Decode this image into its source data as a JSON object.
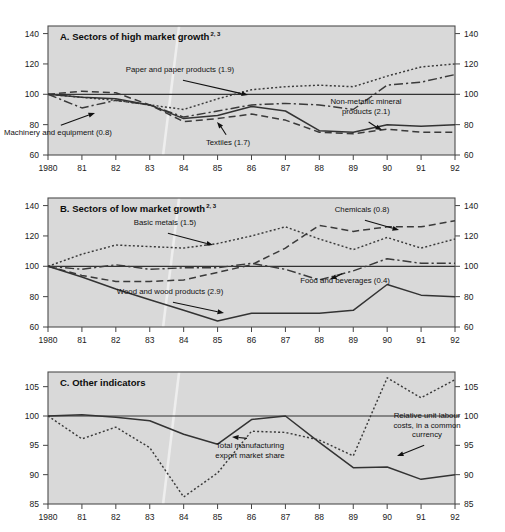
{
  "figure": {
    "width": 505,
    "height": 532,
    "background": "#ffffff",
    "plot_background": "#d9d9d9",
    "frame_color": "#4d4d4d"
  },
  "panels": [
    {
      "id": "panel-a",
      "key": "A",
      "title": "A.   Sectors of high market growth",
      "title_superscript": "2, 3",
      "ylim": [
        60,
        145
      ],
      "yticks": [
        60,
        80,
        100,
        120,
        140
      ],
      "reference_value": 100,
      "xticks": [
        "1980",
        "81",
        "82",
        "83",
        "84",
        "85",
        "86",
        "87",
        "88",
        "89",
        "90",
        "91",
        "92"
      ]
    },
    {
      "id": "panel-b",
      "key": "B",
      "title": "B.   Sectors of low market growth",
      "title_superscript": "2, 3",
      "ylim": [
        60,
        145
      ],
      "yticks": [
        60,
        80,
        100,
        120,
        140
      ],
      "reference_value": 100,
      "xticks": [
        "1980",
        "81",
        "82",
        "83",
        "84",
        "85",
        "86",
        "87",
        "88",
        "89",
        "90",
        "91",
        "92"
      ]
    },
    {
      "id": "panel-c",
      "key": "C",
      "title": "C.   Other indicators",
      "title_superscript": "",
      "ylim": [
        85,
        107.5
      ],
      "yticks": [
        85,
        90,
        95,
        100,
        105
      ],
      "reference_value": 100,
      "xticks": [
        "1980",
        "81",
        "82",
        "83",
        "84",
        "85",
        "86",
        "87",
        "88",
        "89",
        "90",
        "91",
        "92"
      ]
    }
  ],
  "chart_data": [
    {
      "type": "line",
      "panel": "A",
      "title": "A.   Sectors of high market growth",
      "title_superscript": "2, 3",
      "xlabel": "",
      "ylabel": "",
      "x": [
        1980,
        1981,
        1982,
        1983,
        1984,
        1985,
        1986,
        1987,
        1988,
        1989,
        1990,
        1991,
        1992
      ],
      "xtick_labels": [
        "1980",
        "81",
        "82",
        "83",
        "84",
        "85",
        "86",
        "87",
        "88",
        "89",
        "90",
        "91",
        "92"
      ],
      "ylim": [
        60,
        145
      ],
      "yticks": [
        60,
        80,
        100,
        120,
        140
      ],
      "grid": false,
      "reference_line": 100,
      "legend": "inline annotations with arrows",
      "series": [
        {
          "name": "Paper and paper products (1.9)",
          "label": "Paper and paper products (1.9)",
          "style": "dotted",
          "color": "#3a3a3a",
          "values": [
            100,
            98,
            96,
            93,
            90,
            97,
            103,
            105,
            106,
            105,
            112,
            118,
            120
          ]
        },
        {
          "name": "Non-metallic mineral products (2.1)",
          "label": "Non-metallic mineral products (2.1)",
          "style": "dashdot",
          "color": "#3a3a3a",
          "values": [
            100,
            91,
            96,
            93,
            85,
            89,
            93,
            94,
            93,
            90,
            106,
            108,
            113
          ]
        },
        {
          "name": "Textiles (1.7)",
          "label": "Textiles (1.7)",
          "style": "dashed",
          "color": "#3a3a3a",
          "values": [
            100,
            102,
            101,
            93,
            82,
            84,
            87,
            83,
            75,
            74,
            77,
            75,
            75
          ]
        },
        {
          "name": "Machinery and equipment (0.8)",
          "label": "Machinery and equipment (0.8)",
          "style": "solid",
          "color": "#333333",
          "values": [
            100,
            98,
            97,
            93,
            84,
            86,
            92,
            89,
            76,
            75,
            80,
            79,
            80
          ]
        }
      ],
      "annotations": [
        {
          "text": "Paper and paper products (1.9)",
          "tx": 180,
          "ty": 72,
          "ax": 248,
          "ay": 95
        },
        {
          "text": "Non-metallic mineral products (2.1)",
          "tx": 366,
          "ty": 104,
          "ax": 382,
          "ay": 130,
          "lines": [
            "Non-metallic mineral",
            "products (2.1)"
          ]
        },
        {
          "text": "Textiles (1.7)",
          "tx": 228,
          "ty": 145,
          "ax": 217,
          "ay": 122
        },
        {
          "text": "Machinery and equipment (0.8)",
          "tx": 58,
          "ty": 135,
          "ax": 95,
          "ay": 113
        }
      ]
    },
    {
      "type": "line",
      "panel": "B",
      "title": "B.   Sectors of low market growth",
      "title_superscript": "2, 3",
      "xlabel": "",
      "ylabel": "",
      "x": [
        1980,
        1981,
        1982,
        1983,
        1984,
        1985,
        1986,
        1987,
        1988,
        1989,
        1990,
        1991,
        1992
      ],
      "xtick_labels": [
        "1980",
        "81",
        "82",
        "83",
        "84",
        "85",
        "86",
        "87",
        "88",
        "89",
        "90",
        "91",
        "92"
      ],
      "ylim": [
        60,
        145
      ],
      "yticks": [
        60,
        80,
        100,
        120,
        140
      ],
      "grid": false,
      "reference_line": 100,
      "legend": "inline annotations with arrows",
      "series": [
        {
          "name": "Basic metals (1.5)",
          "label": "Basic metals (1.5)",
          "style": "dotted",
          "color": "#3a3a3a",
          "values": [
            100,
            108,
            114,
            113,
            112,
            115,
            120,
            126,
            118,
            111,
            119,
            112,
            118
          ]
        },
        {
          "name": "Chemicals (0.8)",
          "label": "Chemicals (0.8)",
          "style": "dashed",
          "color": "#3a3a3a",
          "values": [
            100,
            94,
            90,
            90,
            91,
            96,
            101,
            112,
            127,
            123,
            126,
            126,
            130
          ]
        },
        {
          "name": "Food and beverages (0.4)",
          "label": "Food and beverages (0.4)",
          "style": "dashdot",
          "color": "#3a3a3a",
          "values": [
            100,
            98,
            101,
            98,
            99,
            99,
            102,
            98,
            91,
            97,
            105,
            102,
            102
          ]
        },
        {
          "name": "Wood and wood products (2.9)",
          "label": "Wood and wood products (2.9)",
          "style": "solid",
          "color": "#333333",
          "values": [
            100,
            93,
            85,
            78,
            71,
            64,
            69,
            69,
            69,
            71,
            88,
            81,
            80
          ]
        }
      ],
      "annotations": [
        {
          "text": "Basic metals (1.5)",
          "tx": 165,
          "ty": 225,
          "ax": 213,
          "ay": 245
        },
        {
          "text": "Chemicals (0.8)",
          "tx": 362,
          "ty": 212,
          "ax": 399,
          "ay": 230
        },
        {
          "text": "Food and beverages (0.4)",
          "tx": 345,
          "ty": 283,
          "ax": 330,
          "ay": 279
        },
        {
          "text": "Wood and wood products (2.9)",
          "tx": 170,
          "ty": 294,
          "ax": 224,
          "ay": 313
        }
      ]
    },
    {
      "type": "line",
      "panel": "C",
      "title": "C.   Other indicators",
      "title_superscript": "",
      "xlabel": "",
      "ylabel": "",
      "x": [
        1980,
        1981,
        1982,
        1983,
        1984,
        1985,
        1986,
        1987,
        1988,
        1989,
        1990,
        1991,
        1992
      ],
      "xtick_labels": [
        "1980",
        "81",
        "82",
        "83",
        "84",
        "85",
        "86",
        "87",
        "88",
        "89",
        "90",
        "91",
        "92"
      ],
      "ylim": [
        85,
        107.5
      ],
      "yticks": [
        85,
        90,
        95,
        100,
        105
      ],
      "grid": false,
      "reference_line": 100,
      "legend": "inline annotations with arrows",
      "series": [
        {
          "name": "Total manufacturing export market share",
          "label": "Total manufacturing export market share",
          "style": "dotted",
          "color": "#3a3a3a",
          "values": [
            100,
            96.1,
            98.1,
            94.6,
            86.2,
            90.3,
            97.4,
            97.2,
            95.9,
            93.2,
            106.5,
            103.1,
            106.2
          ]
        },
        {
          "name": "Relative unit labour costs, in a common currency",
          "label": "Relative unit labour costs, in a common currency",
          "style": "solid",
          "color": "#333333",
          "values": [
            100,
            100.2,
            99.8,
            99.2,
            96.9,
            95.2,
            99.4,
            100,
            95.5,
            91.2,
            91.3,
            89.2,
            90
          ]
        }
      ],
      "annotations": [
        {
          "text": "Total manufacturing export market share",
          "tx": 250,
          "ty": 448,
          "ax": 232,
          "ay": 437,
          "lines": [
            "Total manufacturing",
            "export market share"
          ]
        },
        {
          "text": "Relative unit labour costs, in a common currency",
          "tx": 427,
          "ty": 418,
          "ax": 397,
          "ay": 456,
          "lines": [
            "Relative unit labour",
            "costs, in a common",
            "currency"
          ]
        }
      ]
    }
  ]
}
